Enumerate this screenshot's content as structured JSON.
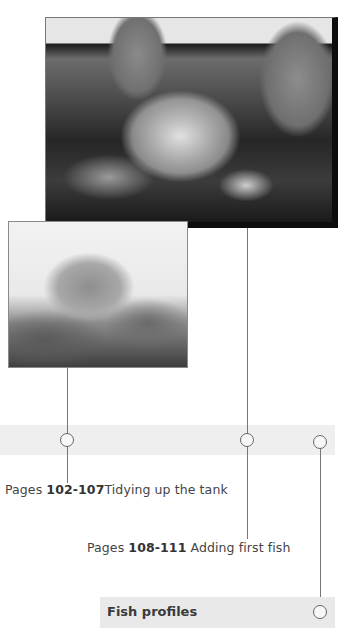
{
  "images": {
    "top_photo": {
      "alt": "Hands opening a plastic bag floating in an aquarium"
    },
    "left_photo": {
      "alt": "Close-up of a hand holding a bag among aquarium plants"
    }
  },
  "timeline": {
    "entries": [
      {
        "pages_label": "Pages",
        "page_range": "102-107",
        "title": "Tidying up the tank"
      },
      {
        "pages_label": "Pages",
        "page_range": "108-111",
        "title": "Adding first fish"
      }
    ],
    "section": {
      "label": "Fish profiles"
    }
  },
  "colors": {
    "band": "#efefef",
    "line": "#777777",
    "text": "#444444"
  }
}
